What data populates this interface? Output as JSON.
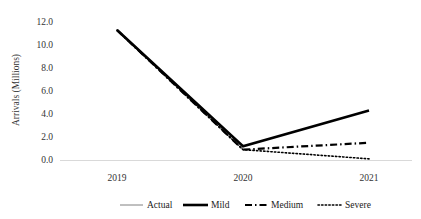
{
  "chart_data": {
    "type": "line",
    "title": "",
    "xlabel": "",
    "ylabel": "Arrivals (Millions)",
    "categories": [
      "2019",
      "2020",
      "2021"
    ],
    "x_tick_labels": [
      "2019",
      "2020",
      "2021"
    ],
    "y_tick_labels": [
      "0.0",
      "2.0",
      "4.0",
      "6.0",
      "8.0",
      "10.0",
      "12.0"
    ],
    "y_ticks": [
      0.0,
      2.0,
      4.0,
      6.0,
      8.0,
      10.0,
      12.0
    ],
    "ylim": [
      0.0,
      12.0
    ],
    "grid": false,
    "legend_position": "bottom",
    "series": [
      {
        "name": "Actual",
        "style": "thin-solid",
        "color": "#808080",
        "values": [
          11.3,
          0.9,
          null
        ]
      },
      {
        "name": "Mild",
        "style": "thick-solid",
        "color": "#000000",
        "values": [
          11.3,
          1.2,
          4.3
        ]
      },
      {
        "name": "Medium",
        "style": "dash-dot",
        "color": "#000000",
        "values": [
          11.3,
          0.9,
          1.5
        ]
      },
      {
        "name": "Severe",
        "style": "dotted",
        "color": "#000000",
        "values": [
          11.3,
          0.9,
          0.1
        ]
      }
    ]
  },
  "legend": {
    "items": [
      {
        "label": "Actual",
        "style": "thin-solid"
      },
      {
        "label": "Mild",
        "style": "thick-solid"
      },
      {
        "label": "Medium",
        "style": "dash-dot"
      },
      {
        "label": "Severe",
        "style": "dotted"
      }
    ]
  },
  "axes": {
    "y_title": "Arrivals (Millions)"
  },
  "colors": {
    "line": "#000000",
    "actual_line": "#808080",
    "axis": "#d9d9d9",
    "text": "#333333",
    "background": "#ffffff"
  }
}
